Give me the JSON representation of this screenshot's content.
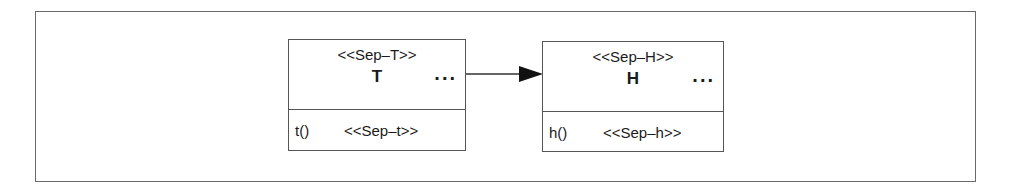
{
  "diagram": {
    "type": "uml-class-diagram",
    "classes": [
      {
        "stereotype": "<<Sep–T>>",
        "name": "T",
        "ellipsis": "...",
        "operation": "t()",
        "operation_stereotype": "<<Sep–t>>"
      },
      {
        "stereotype": "<<Sep–H>>",
        "name": "H",
        "ellipsis": "...",
        "operation": "h()",
        "operation_stereotype": "<<Sep–h>>"
      }
    ],
    "edges": [
      {
        "from": "T",
        "to": "H",
        "kind": "directed-association",
        "arrowhead": "filled-triangle"
      }
    ],
    "colors": {
      "line": "#555555",
      "frame": "#6a6a6a",
      "background": "#ffffff"
    }
  }
}
